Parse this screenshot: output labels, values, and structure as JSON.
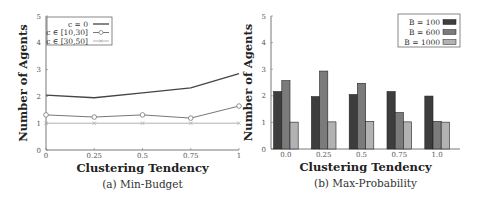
{
  "chart_data": [
    {
      "type": "line",
      "caption": "(a) Min-Budget",
      "xlabel": "Clustering Tendency",
      "ylabel": "Number of Agents",
      "x": [
        0,
        0.25,
        0.5,
        0.75,
        1
      ],
      "x_tick_labels": [
        "0",
        "0.25",
        "0.5",
        "0.75",
        "1"
      ],
      "y_ticks": [
        0,
        1,
        2,
        3,
        4,
        5
      ],
      "ylim": [
        0,
        5
      ],
      "xlim": [
        0,
        1
      ],
      "grid": false,
      "legend_position": "upper left",
      "series": [
        {
          "name": "c = 0",
          "marker": "none",
          "color": "#444444",
          "values": [
            2.05,
            1.95,
            2.13,
            2.32,
            2.85
          ]
        },
        {
          "name": "c ∈ [10,30]",
          "marker": "circle",
          "color": "#777777",
          "values": [
            1.31,
            1.23,
            1.31,
            1.19,
            1.64
          ]
        },
        {
          "name": "c ∈ [30,50]",
          "marker": "x",
          "color": "#aaaaaa",
          "values": [
            1.0,
            1.0,
            1.0,
            1.0,
            1.0
          ]
        }
      ]
    },
    {
      "type": "bar",
      "caption": "(b) Max-Probability",
      "xlabel": "Clustering Tendency",
      "ylabel": "Number of Agents",
      "categories": [
        "0.0",
        "0.25",
        "0.5",
        "0.75",
        "1.0"
      ],
      "y_ticks": [
        0,
        1,
        2,
        3,
        4,
        5
      ],
      "ylim": [
        0,
        5
      ],
      "grid": false,
      "legend_position": "upper right",
      "series": [
        {
          "name": "B = 100",
          "color": "#3d3d3d",
          "values": [
            2.16,
            1.97,
            2.05,
            2.16,
            1.99
          ]
        },
        {
          "name": "B = 600",
          "color": "#7b7b7b",
          "values": [
            2.57,
            2.93,
            2.47,
            1.37,
            1.04
          ]
        },
        {
          "name": "B = 1000",
          "color": "#b2b2b2",
          "values": [
            1.01,
            1.02,
            1.04,
            1.02,
            1.01
          ]
        }
      ]
    }
  ]
}
